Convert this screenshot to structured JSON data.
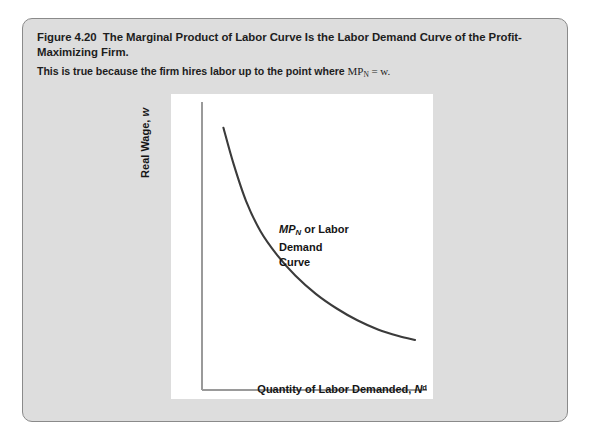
{
  "figure": {
    "label": "Figure 4.20",
    "title": "The Marginal Product of Labor Curve Is the Labor Demand Curve of the Profit-Maximizing Firm.",
    "subtitle_prefix": "This is true because the firm hires labor up to the point where",
    "subtitle_math_base": "MP",
    "subtitle_math_sub": "N",
    "subtitle_math_rest": " = w.",
    "panel_background": "#dddddd",
    "panel_border": "#8a8a8a"
  },
  "chart_data": {
    "type": "line",
    "title": "",
    "xlabel_text": "Quantity of Labor Demanded, ",
    "xlabel_symbol": "N",
    "xlabel_superscript": "d",
    "ylabel_text": "Real Wage, ",
    "ylabel_symbol": "w",
    "series": [
      {
        "name": "MP_N or Labor Demand Curve",
        "label_line1_math_base": "MP",
        "label_line1_math_sub": "N",
        "label_line1_rest": " or Labor Demand",
        "label_line2": "Curve",
        "color": "#3b3b3b",
        "x": [
          0.07,
          0.12,
          0.18,
          0.25,
          0.33,
          0.42,
          0.52,
          0.62,
          0.72,
          0.82,
          0.92,
          1.0
        ],
        "y": [
          0.94,
          0.8,
          0.66,
          0.545,
          0.455,
          0.375,
          0.305,
          0.25,
          0.205,
          0.17,
          0.145,
          0.13
        ]
      }
    ],
    "xlim": [
      0,
      1
    ],
    "ylim": [
      0,
      1
    ],
    "grid": false,
    "legend": "none",
    "axis_color": "#9a9a9a",
    "plot_background": "#ffffff"
  }
}
